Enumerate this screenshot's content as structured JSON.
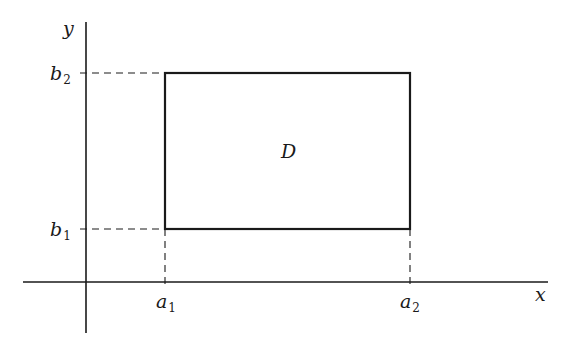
{
  "diagram": {
    "type": "rectangular-region",
    "region_label": "D",
    "axes": {
      "x_label": "x",
      "y_label": "y"
    },
    "x_bounds": [
      {
        "var": "a",
        "sub": "1"
      },
      {
        "var": "a",
        "sub": "2"
      }
    ],
    "y_bounds": [
      {
        "var": "b",
        "sub": "1"
      },
      {
        "var": "b",
        "sub": "2"
      }
    ],
    "colors": {
      "ink": "#1a1a1a",
      "background": "#ffffff"
    }
  }
}
